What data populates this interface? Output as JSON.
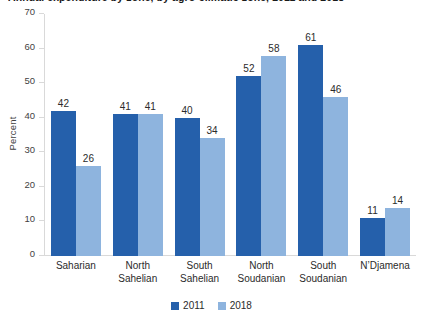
{
  "chart_data": {
    "type": "bar",
    "title": "Annual expenditure by zone, by agro-climatic zone, 2011 and 2018",
    "xlabel": "",
    "ylabel": "Percent",
    "ylim": [
      0,
      70
    ],
    "ytick_step": 10,
    "yticks": [
      70,
      60,
      50,
      40,
      30,
      20,
      10,
      0
    ],
    "grid": false,
    "legend_position": "bottom",
    "categories": [
      "Saharian",
      "North Sahelian",
      "South Sahelian",
      "North Soudanian",
      "South Soudanian",
      "N’Djamena"
    ],
    "category_lines": [
      [
        "Saharian"
      ],
      [
        "North",
        "Sahelian"
      ],
      [
        "South",
        "Sahelian"
      ],
      [
        "North",
        "Soudanian"
      ],
      [
        "South",
        "Soudanian"
      ],
      [
        "N’Djamena"
      ]
    ],
    "series": [
      {
        "name": "2011",
        "color": "#2560ab",
        "values": [
          42,
          41,
          40,
          52,
          61,
          11
        ]
      },
      {
        "name": "2018",
        "color": "#8eb4de",
        "values": [
          26,
          41,
          34,
          58,
          46,
          14
        ]
      }
    ]
  },
  "colors": {
    "series_2011": "#2560ab",
    "series_2018": "#8eb4de",
    "axis": "#d9d9d9",
    "text": "#2b2b2b",
    "background": "#ffffff"
  }
}
